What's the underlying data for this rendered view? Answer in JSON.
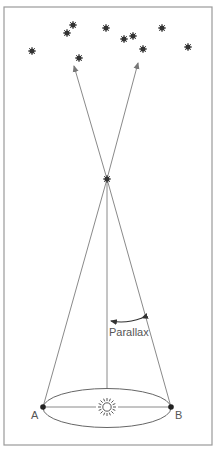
{
  "diagram": {
    "type": "stellar-parallax",
    "labels": {
      "parallax": "Parallax",
      "point_a": "A",
      "point_b": "B"
    },
    "icons": {
      "sun": "sun-icon",
      "nearby_star": "star-icon",
      "background_stars": "star-icon"
    },
    "colors": {
      "frame": "#9a9a9a",
      "lines": "#8a8a8a",
      "stars": "#333333",
      "text": "#555555",
      "background": "#ffffff"
    }
  }
}
